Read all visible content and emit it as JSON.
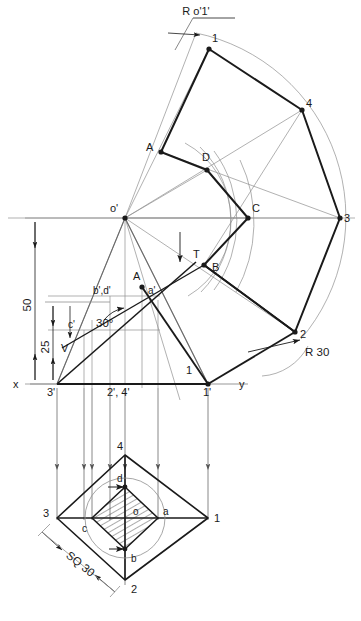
{
  "drawing": {
    "title_label": "R o'1'",
    "radius_label": "R 30",
    "square_label": "SQ 30",
    "angle_label": "30°",
    "dim_50": "50",
    "dim_25": "25",
    "axis_x": "x",
    "axis_y": "y",
    "apex_label": "o'",
    "trace_label": "V",
    "tangent_label": "T"
  },
  "front_view": {
    "points": [
      {
        "name": "apex-o-prime",
        "label": "o'",
        "x": 125,
        "y": 218,
        "lx": 112,
        "ly": 211
      },
      {
        "name": "point-3-prime",
        "label": "3'",
        "x": 57,
        "y": 384,
        "lx": 50,
        "ly": 396
      },
      {
        "name": "point-2-4-prime",
        "label": "2', 4'",
        "x": 125,
        "y": 384,
        "lx": 110,
        "ly": 396
      },
      {
        "name": "point-1-prime",
        "label": "1'",
        "x": 208,
        "y": 384,
        "lx": 203,
        "ly": 396
      },
      {
        "name": "point-1-front",
        "label": "1",
        "x": 208,
        "y": 384,
        "lx": 190,
        "ly": 375
      },
      {
        "name": "point-c-prime",
        "label": "c'",
        "x": 84,
        "y": 330,
        "lx": 72,
        "ly": 327
      },
      {
        "name": "point-bd-prime",
        "label": "b',d'",
        "x": 110,
        "y": 296,
        "lx": 96,
        "ly": 293
      },
      {
        "name": "point-a-prime",
        "label": "a'",
        "x": 142,
        "y": 287,
        "lx": 150,
        "ly": 292
      },
      {
        "name": "point-a-front",
        "label": "A",
        "x": 142,
        "y": 287,
        "lx": 136,
        "ly": 277
      },
      {
        "name": "vertical-trace",
        "label": "V",
        "x": 70,
        "y": 344,
        "lx": 64,
        "ly": 351
      }
    ]
  },
  "development": {
    "points": [
      {
        "name": "dev-point-1",
        "label": "1",
        "x": 209,
        "y": 49,
        "lx": 212,
        "ly": 42
      },
      {
        "name": "dev-point-4",
        "label": "4",
        "x": 302,
        "y": 110,
        "lx": 306,
        "ly": 106
      },
      {
        "name": "dev-point-3",
        "label": "3",
        "x": 340,
        "y": 218,
        "lx": 344,
        "ly": 222
      },
      {
        "name": "dev-point-2",
        "label": "2",
        "x": 295,
        "y": 332,
        "lx": 300,
        "ly": 337
      },
      {
        "name": "dev-point-A",
        "label": "A",
        "x": 161,
        "y": 152,
        "lx": 148,
        "ly": 148
      },
      {
        "name": "dev-point-D",
        "label": "D",
        "x": 207,
        "y": 170,
        "lx": 203,
        "ly": 160
      },
      {
        "name": "dev-point-C",
        "label": "C",
        "x": 248,
        "y": 218,
        "lx": 252,
        "ly": 211
      },
      {
        "name": "dev-point-B",
        "label": "B",
        "x": 204,
        "y": 265,
        "lx": 212,
        "ly": 268
      },
      {
        "name": "dev-point-T",
        "label": "T",
        "x": 196,
        "y": 262,
        "lx": 196,
        "ly": 256
      }
    ]
  },
  "top_view": {
    "points": [
      {
        "name": "tv-point-1",
        "label": "1",
        "x": 208,
        "y": 518,
        "lx": 214,
        "ly": 522
      },
      {
        "name": "tv-point-2",
        "label": "2",
        "x": 125,
        "y": 580,
        "lx": 131,
        "ly": 592
      },
      {
        "name": "tv-point-3",
        "label": "3",
        "x": 57,
        "y": 518,
        "lx": 45,
        "ly": 516
      },
      {
        "name": "tv-point-4",
        "label": "4",
        "x": 125,
        "y": 455,
        "lx": 119,
        "ly": 448
      },
      {
        "name": "tv-point-a",
        "label": "a",
        "x": 158,
        "y": 518,
        "lx": 163,
        "ly": 515
      },
      {
        "name": "tv-point-b",
        "label": "b",
        "x": 125,
        "y": 549,
        "lx": 131,
        "ly": 560
      },
      {
        "name": "tv-point-c",
        "label": "c",
        "x": 92,
        "y": 518,
        "lx": 84,
        "ly": 530
      },
      {
        "name": "tv-point-d",
        "label": "d",
        "x": 125,
        "y": 487,
        "lx": 118,
        "ly": 481
      },
      {
        "name": "tv-point-o",
        "label": "o",
        "x": 125,
        "y": 518,
        "lx": 134,
        "ly": 515
      }
    ]
  },
  "projectors": {
    "x_positions": [
      57,
      84,
      92,
      110,
      125,
      158,
      208
    ],
    "top": 388,
    "bottom": 470
  },
  "colors": {
    "ink": "#1a1a1a",
    "construction": "#8a8a8a",
    "hatch": "#2a2a2a",
    "paper": "#ffffff"
  },
  "caption": {
    "bold": "",
    "rest": ""
  }
}
